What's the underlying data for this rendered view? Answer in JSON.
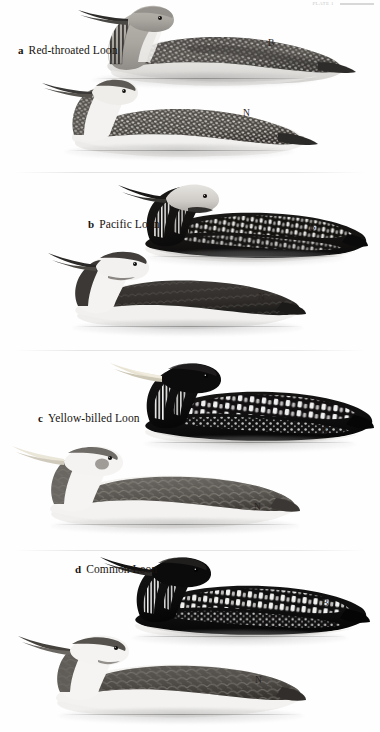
{
  "plate": {
    "header": {
      "text": "PLATE 1",
      "rule_icon": "horizontal-rule-icon"
    },
    "medium": "grayscale field-guide illustration plate",
    "subject_group": "Loons (Gaviidae)",
    "plumage_key": {
      "B": "Breeding plumage",
      "N": "Nonbreeding plumage"
    },
    "species": [
      {
        "letter": "a",
        "name": "Red-throated Loon",
        "label_x": 18,
        "label_y": 44,
        "figures": [
          {
            "tag": "B",
            "tag_x": 268,
            "tag_y": 38,
            "plumage": "breeding, swimming adult"
          },
          {
            "tag": "N",
            "tag_x": 243,
            "tag_y": 108,
            "plumage": "nonbreeding, swimming adult"
          }
        ]
      },
      {
        "letter": "b",
        "name": "Pacific Loon",
        "label_x": 88,
        "label_y": 218,
        "figures": [
          {
            "tag": "B",
            "tag_x": 309,
            "tag_y": 222,
            "plumage": "breeding, swimming adult"
          },
          {
            "tag": "N",
            "tag_x": 258,
            "tag_y": 292,
            "plumage": "nonbreeding, swimming adult"
          }
        ]
      },
      {
        "letter": "c",
        "name": "Yellow-billed Loon",
        "label_x": 38,
        "label_y": 412,
        "figures": [
          {
            "tag": "B",
            "tag_x": 321,
            "tag_y": 426,
            "plumage": "breeding, swimming adult"
          },
          {
            "tag": "N",
            "tag_x": 254,
            "tag_y": 502,
            "plumage": "nonbreeding, swimming adult"
          }
        ]
      },
      {
        "letter": "d",
        "name": "Common Loon",
        "label_x": 75,
        "label_y": 563,
        "figures": [
          {
            "tag": "B",
            "tag_x": 322,
            "tag_y": 598,
            "plumage": "breeding, swimming adult"
          },
          {
            "tag": "N",
            "tag_x": 255,
            "tag_y": 675,
            "plumage": "nonbreeding, swimming adult"
          }
        ]
      }
    ],
    "colors": {
      "ink": "#17130f",
      "paper": "#fefefe",
      "dark_plumage": "#121212",
      "mid_gray": "#6e6e6e",
      "pale_gray": "#c9c9c9",
      "water_wash": "#b4b4b4"
    }
  }
}
